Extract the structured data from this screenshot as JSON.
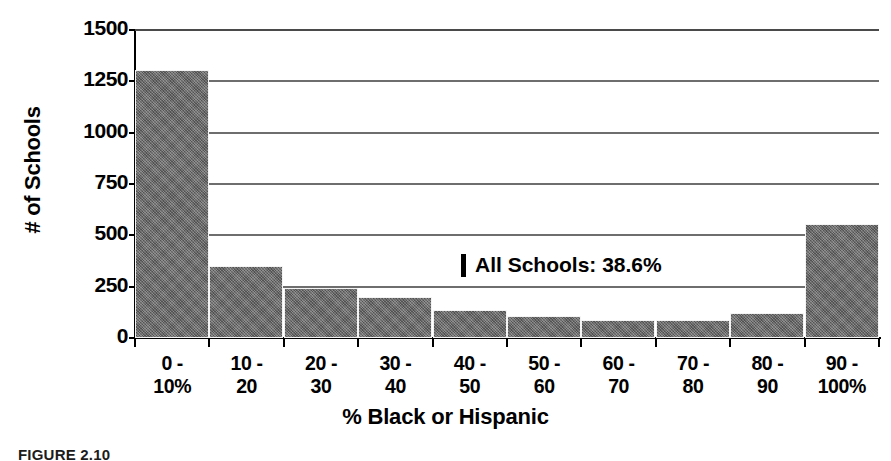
{
  "chart_data": {
    "type": "bar",
    "title": "",
    "xlabel": "% Black or Hispanic",
    "ylabel": "# of Schools",
    "categories": [
      "0 -\n10%",
      "10 -\n20",
      "20 -\n30",
      "30 -\n40",
      "40 -\n50",
      "50 -\n60",
      "60 -\n70",
      "70 -\n80",
      "80 -\n90",
      "90 -\n100%"
    ],
    "category_lines": [
      [
        "0 -",
        "10%"
      ],
      [
        "10 -",
        "20"
      ],
      [
        "20 -",
        "30"
      ],
      [
        "30 -",
        "40"
      ],
      [
        "40 -",
        "50"
      ],
      [
        "50 -",
        "60"
      ],
      [
        "60 -",
        "70"
      ],
      [
        "70 -",
        "80"
      ],
      [
        "80 -",
        "90"
      ],
      [
        "90 -",
        "100%"
      ]
    ],
    "values": [
      1305,
      350,
      245,
      200,
      137,
      107,
      88,
      88,
      122,
      555
    ],
    "ylim": [
      0,
      1500
    ],
    "yticks": [
      0,
      250,
      500,
      750,
      1000,
      1250,
      1500
    ],
    "ytick_labels": [
      "0",
      "250",
      "500",
      "750",
      "1000",
      "1250",
      "1500"
    ],
    "grid": "horizontal",
    "legend": "none",
    "bar_color": "#6a6a6a",
    "annotations": [
      {
        "marker": "|",
        "text": "All Schools: 38.6%",
        "value": 38.6
      }
    ]
  },
  "caption": "FIGURE 2.10"
}
